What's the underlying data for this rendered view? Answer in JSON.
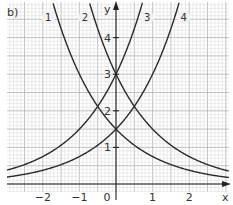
{
  "panel_label": "b)",
  "chart_data": {
    "type": "line",
    "title": "",
    "xlabel": "x",
    "ylabel": "y",
    "xlim": [
      -3.0,
      3.0
    ],
    "ylim": [
      -0.3,
      4.95
    ],
    "grid": true,
    "grid_minor_step": 0.1,
    "grid_major_step": 0.5,
    "x_ticks": [
      -2,
      -1,
      0,
      1,
      2
    ],
    "x_tick_labels": [
      "−2",
      "−1",
      "0",
      "1",
      "2"
    ],
    "y_ticks": [
      1,
      2,
      3,
      4
    ],
    "y_tick_labels": [
      "1",
      "2",
      "3",
      "4"
    ],
    "legend": "none",
    "series": [
      {
        "name": "1",
        "formula": "1.5·2^(−x)",
        "a": 1.5,
        "b": 0.5,
        "label_x": -1.85,
        "label_y": 4.55
      },
      {
        "name": "2",
        "formula": "3·2^(−x)",
        "a": 3.0,
        "b": 0.5,
        "label_x": -0.85,
        "label_y": 4.55
      },
      {
        "name": "3",
        "formula": "3·2^x",
        "a": 3.0,
        "b": 2.0,
        "label_x": 0.85,
        "label_y": 4.55
      },
      {
        "name": "4",
        "formula": "1.5·2^x",
        "a": 1.5,
        "b": 2.0,
        "label_x": 1.85,
        "label_y": 4.55
      }
    ],
    "annotations": [
      {
        "text": "intersection",
        "x": -0.5,
        "y": 2.12
      },
      {
        "text": "intersection",
        "x": 0.5,
        "y": 2.12
      },
      {
        "text": "y-intercept",
        "x": 0,
        "y": 3
      },
      {
        "text": "y-intercept",
        "x": 0,
        "y": 1.5
      }
    ]
  }
}
